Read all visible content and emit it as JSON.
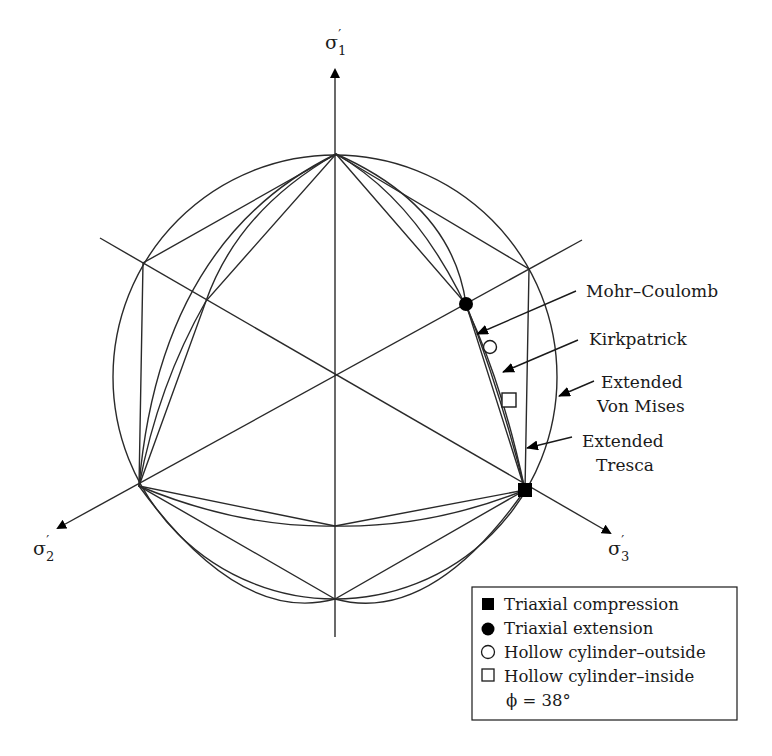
{
  "figure": {
    "type": "deviatoric-plane failure criteria diagram",
    "axes": [
      {
        "id": "sigma1",
        "label": "σ",
        "sub": "1",
        "prime": "′",
        "direction": "up"
      },
      {
        "id": "sigma2",
        "label": "σ",
        "sub": "2",
        "prime": "′",
        "direction": "lower-left"
      },
      {
        "id": "sigma3",
        "label": "σ",
        "sub": "3",
        "prime": "′",
        "direction": "lower-right"
      }
    ],
    "callouts": {
      "mohr_coulomb": "Mohr–Coulomb",
      "kirkpatrick": "Kirkpatrick",
      "von_mises_line1": "Extended",
      "von_mises_line2": "Von Mises",
      "tresca_line1": "Extended",
      "tresca_line2": "Tresca"
    },
    "legend": {
      "items": [
        {
          "symbol": "filled-square",
          "label": "Triaxial compression"
        },
        {
          "symbol": "filled-circle",
          "label": "Triaxial extension"
        },
        {
          "symbol": "open-circle",
          "label": "Hollow cylinder–outside"
        },
        {
          "symbol": "open-square",
          "label": "Hollow cylinder–inside"
        }
      ],
      "note": "ϕ = 38°"
    },
    "colors": {
      "line": "#2a2a2a",
      "marker": "#000000",
      "background": "#ffffff"
    }
  }
}
